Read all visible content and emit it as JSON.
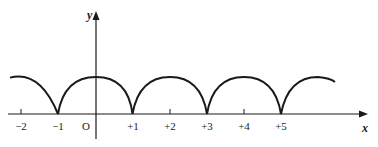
{
  "axes": {
    "x_label": "x",
    "y_label": "y",
    "origin_label": "O"
  },
  "ticks": [
    {
      "value": -2,
      "label": "−2"
    },
    {
      "value": -1,
      "label": "−1"
    },
    {
      "value": 1,
      "label": "+1"
    },
    {
      "value": 2,
      "label": "+2"
    },
    {
      "value": 3,
      "label": "+3"
    },
    {
      "value": 4,
      "label": "+4"
    },
    {
      "value": 5,
      "label": "+5"
    }
  ],
  "curve": {
    "description": "periodic arches touching x-axis at odd integers",
    "zeros": [
      -1,
      1,
      3,
      5
    ],
    "peaks": [
      -2,
      0,
      2,
      4
    ],
    "x_range": [
      -2.3,
      6.4
    ],
    "color": "#1a1a1a"
  }
}
